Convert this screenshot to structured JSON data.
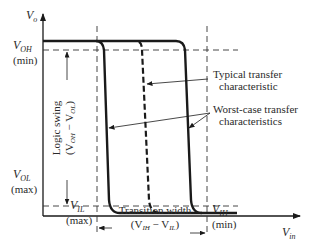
{
  "diagram": {
    "type": "voltage transfer characteristic",
    "axes": {
      "y_label": "V",
      "y_label_sub": "o",
      "x_label": "V",
      "x_label_sub": "in"
    },
    "levels": {
      "voh_label": "V",
      "voh_sub": "OH",
      "voh_qual": "(min)",
      "vol_label": "V",
      "vol_sub": "OL",
      "vol_qual": "(max)",
      "vil_label": "V",
      "vil_sub": "IL",
      "vil_qual": "(max)",
      "vih_label": "V",
      "vih_sub": "IH",
      "vih_qual": "(min)"
    },
    "annotations": {
      "logic_swing_line1": "Logic swing",
      "logic_swing_line2_open": "(V",
      "logic_swing_sub1": "OH",
      "logic_swing_minus": " − V",
      "logic_swing_sub2": "OL",
      "logic_swing_close": ")",
      "transition_line1": "Transition width",
      "transition_open": "(V",
      "transition_sub1": "IH",
      "transition_minus": " − V",
      "transition_sub2": "IL",
      "transition_close": ")",
      "typical_line1": "Typical transfer",
      "typical_line2": "characteristic",
      "worst_line1": "Worst-case transfer",
      "worst_line2": "characteristics"
    },
    "curves": [
      {
        "name": "worst-case-left",
        "style": "solid"
      },
      {
        "name": "typical",
        "style": "dashed"
      },
      {
        "name": "worst-case-right",
        "style": "solid"
      }
    ],
    "colors": {
      "ink": "#1a1a1a",
      "background": "#ffffff"
    }
  }
}
